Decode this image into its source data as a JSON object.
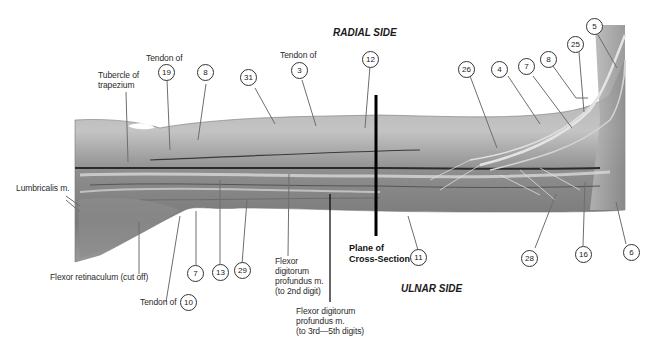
{
  "figure": {
    "orientation_labels": {
      "top": "RADIAL SIDE",
      "bottom": "ULNAR SIDE"
    },
    "plane_label": {
      "line1": "Plane of",
      "line2": "Cross-Section"
    },
    "text_labels": {
      "tubercle": [
        "Tubercle of",
        "trapezium"
      ],
      "tendon19_prefix": "Tendon of",
      "tendon3_prefix": "Tendon of",
      "tendon10_prefix": "Tendon of",
      "lumbricalis": "Lumbricalis m.",
      "flexor_retinaculum": "Flexor retinaculum (cut off)",
      "fdp_2nd": [
        "Flexor",
        "digitorum",
        "profundus m.",
        "(to 2nd digit)"
      ],
      "fdp_3to5": [
        "Flexor digitorum",
        "profundus m.",
        "(to 3rd—5th digits)"
      ]
    },
    "numbered_callouts": [
      {
        "id": "19",
        "label": "19"
      },
      {
        "id": "8a",
        "label": "8"
      },
      {
        "id": "31",
        "label": "31"
      },
      {
        "id": "3",
        "label": "3"
      },
      {
        "id": "12",
        "label": "12"
      },
      {
        "id": "26",
        "label": "26"
      },
      {
        "id": "4",
        "label": "4"
      },
      {
        "id": "7a",
        "label": "7"
      },
      {
        "id": "8b",
        "label": "8"
      },
      {
        "id": "25",
        "label": "25"
      },
      {
        "id": "5",
        "label": "5"
      },
      {
        "id": "7b",
        "label": "7"
      },
      {
        "id": "13",
        "label": "13"
      },
      {
        "id": "29",
        "label": "29"
      },
      {
        "id": "10",
        "label": "10"
      },
      {
        "id": "11",
        "label": "11"
      },
      {
        "id": "28",
        "label": "28"
      },
      {
        "id": "16",
        "label": "16"
      },
      {
        "id": "6",
        "label": "6"
      }
    ]
  }
}
